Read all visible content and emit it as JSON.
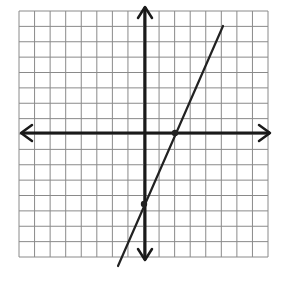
{
  "chart_data": {
    "type": "line",
    "title": "",
    "xlabel": "",
    "ylabel": "",
    "grid": true,
    "grid_cells": {
      "columns": 16,
      "rows": 16
    },
    "xlim": [
      -8,
      8
    ],
    "ylim": [
      -8,
      8
    ],
    "axes": {
      "x_arrows": true,
      "y_arrows": true,
      "origin_col": 8,
      "origin_row": 8
    },
    "series": [
      {
        "name": "line",
        "slope_estimate": 2.25,
        "y_intercept_estimate": -4.5,
        "x": [
          -1.75,
          5
        ],
        "y": [
          -8.5,
          6.8
        ],
        "marked_points": [
          {
            "label": "x-intercept",
            "x": 2,
            "y": 0
          },
          {
            "label": "y-intercept",
            "x": 0,
            "y": -4.5
          }
        ]
      }
    ]
  },
  "colors": {
    "grid": "#8a8a8a",
    "axis": "#1a1a1a",
    "line": "#222222",
    "background": "#ffffff"
  },
  "geometry": {
    "grid_left": 19,
    "grid_top": 11,
    "grid_right": 268,
    "grid_bottom": 257,
    "origin_px": [
      145,
      133
    ],
    "line_px": [
      [
        118,
        266
      ],
      [
        223,
        26
      ]
    ],
    "points_px": [
      [
        175,
        133
      ],
      [
        144,
        204
      ]
    ]
  }
}
